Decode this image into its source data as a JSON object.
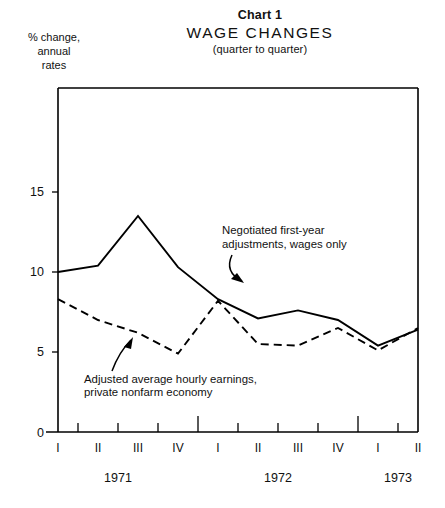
{
  "header": {
    "chart_number": "Chart 1",
    "title": "WAGE  CHANGES",
    "subtitle": "(quarter to quarter)"
  },
  "y_axis_caption": {
    "line1": "% change,",
    "line2": "annual",
    "line3": "rates"
  },
  "annotations": {
    "series1": {
      "line1": "Negotiated first-year",
      "line2": "adjustments, wages only"
    },
    "series2": {
      "line1": "Adjusted average hourly earnings,",
      "line2": "private nonfarm economy"
    }
  },
  "chart_data": {
    "type": "line",
    "title": "WAGE  CHANGES",
    "subtitle": "(quarter to quarter)",
    "chart_number": "Chart 1",
    "xlabel": "",
    "ylabel": "% change, annual rates",
    "ylim": [
      0,
      17.5
    ],
    "yticks": [
      0,
      5,
      10,
      15
    ],
    "ytick_labels": [
      "0",
      "5",
      "10",
      "15"
    ],
    "grid": false,
    "legend": "annotated-inline",
    "x": [
      "1971 I",
      "1971 II",
      "1971 III",
      "1971 IV",
      "1972 I",
      "1972 II",
      "1972 III",
      "1972 IV",
      "1973 I",
      "1973 II"
    ],
    "quarter_labels": [
      "I",
      "II",
      "III",
      "IV",
      "I",
      "II",
      "III",
      "IV",
      "I",
      "II"
    ],
    "year_groups": [
      {
        "label": "1971",
        "quarters": [
          "I",
          "II",
          "III",
          "IV"
        ]
      },
      {
        "label": "1972",
        "quarters": [
          "I",
          "II",
          "III",
          "IV"
        ]
      },
      {
        "label": "1973",
        "quarters": [
          "I",
          "II"
        ]
      }
    ],
    "series": [
      {
        "name": "Negotiated first-year adjustments, wages only",
        "style": "solid",
        "values": [
          10.0,
          10.4,
          13.5,
          10.3,
          8.3,
          7.1,
          7.6,
          7.0,
          5.4,
          6.4
        ]
      },
      {
        "name": "Adjusted average hourly earnings, private nonfarm economy",
        "style": "dashed",
        "values": [
          8.3,
          7.0,
          6.2,
          4.9,
          8.2,
          5.5,
          5.4,
          6.5,
          5.1,
          6.5
        ]
      }
    ]
  }
}
